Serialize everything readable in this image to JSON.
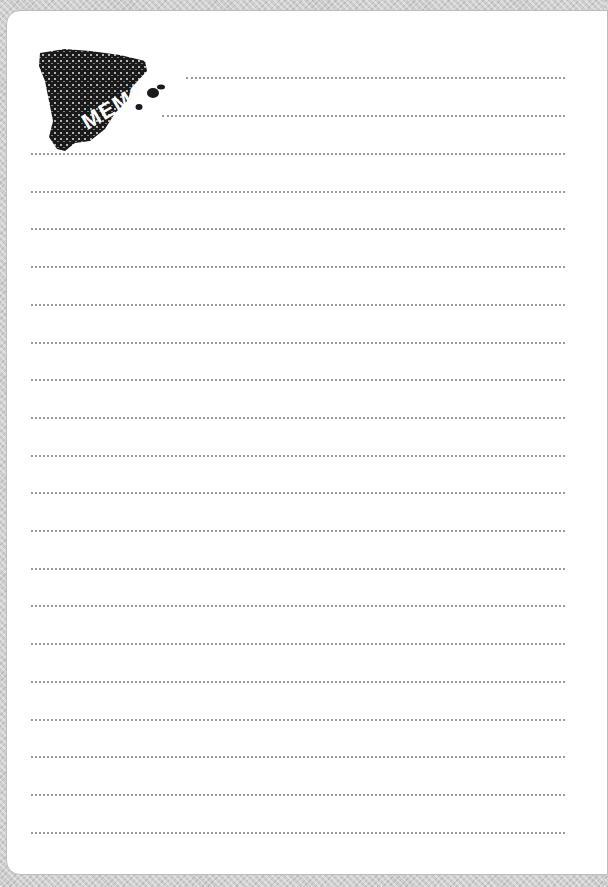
{
  "memo": {
    "logo_text": "MEMO",
    "logo_shape": "spain-map-icon",
    "line_count": 19,
    "header_lines": 2
  },
  "colors": {
    "border_pattern": "#cfcfcf",
    "paper": "#ffffff",
    "line": "#9a9a9a",
    "logo": "#1a1a1a"
  }
}
